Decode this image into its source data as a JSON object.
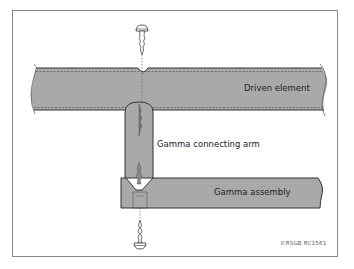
{
  "diagram": {
    "labels": {
      "driven_element": "Driven element",
      "connecting_arm": "Gamma connecting arm",
      "gamma_assembly": "Gamma assembly",
      "copyright": "©RSGB RC1561"
    },
    "colors": {
      "fill": "#a9a9a9",
      "outline": "#333333",
      "frame": "#888888",
      "background": "#ffffff"
    },
    "components": [
      "frame-border",
      "driven-element",
      "gamma-connecting-arm",
      "gamma-assembly",
      "top-screw",
      "bottom-screw"
    ]
  }
}
